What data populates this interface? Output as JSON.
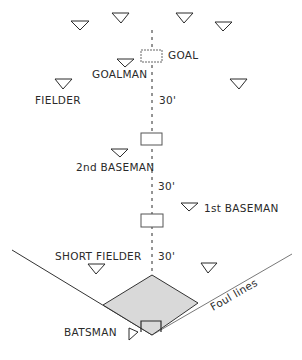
{
  "diagram": {
    "labels": {
      "goal": "GOAL",
      "goalman": "GOALMAN",
      "fielder": "FIELDER",
      "second_baseman": "2nd BASEMAN",
      "first_baseman": "1st BASEMAN",
      "short_fielder": "SHORT FIELDER",
      "batsman": "BATSMAN",
      "foul_lines": "Foul lines"
    },
    "distances": [
      "30'",
      "30'",
      "30'"
    ],
    "colors": {
      "ink": "#2a2a2a",
      "infield_fill": "#d9d9d9"
    }
  }
}
